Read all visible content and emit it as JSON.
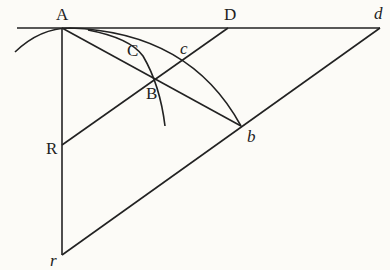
{
  "diagram": {
    "type": "geometric-construction",
    "points": {
      "A": {
        "label": "A",
        "x": 62,
        "y": 28
      },
      "D": {
        "label": "D",
        "x": 228,
        "y": 28
      },
      "d": {
        "label": "d",
        "x": 380,
        "y": 28
      },
      "C": {
        "label": "C",
        "x": 128,
        "y": 47
      },
      "c": {
        "label": "c",
        "x": 182,
        "y": 60
      },
      "B": {
        "label": "B",
        "x": 154,
        "y": 80
      },
      "b": {
        "label": "b",
        "x": 241,
        "y": 126
      },
      "R": {
        "label": "R",
        "x": 62,
        "y": 145
      },
      "r": {
        "label": "r",
        "x": 62,
        "y": 255
      }
    },
    "segments": [
      "A-d (horizontal)",
      "A-r (vertical)",
      "A-b",
      "R-D",
      "r-d"
    ],
    "arcs": [
      "large arc through A to b",
      "small arc through C to below B"
    ],
    "stroke_color": "#222222",
    "background_color": "#fcfbf7"
  }
}
